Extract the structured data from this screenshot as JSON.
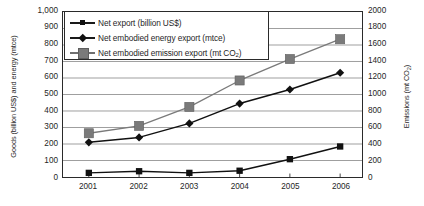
{
  "chart_data": {
    "type": "line",
    "title": "",
    "subtitle": "",
    "categories": [
      "2001",
      "2002",
      "2003",
      "2004",
      "2005",
      "2006"
    ],
    "x": [
      2001,
      2002,
      2003,
      2004,
      2005,
      2006
    ],
    "xlabel": "",
    "ylabel": "Goods (billion US$) and energy (mtce)",
    "y2label": "Emissions (mt CO2)",
    "ylim": [
      0,
      1000
    ],
    "y2lim": [
      0,
      2000
    ],
    "yticks": [
      "0",
      "100",
      "200",
      "300",
      "400",
      "500",
      "600",
      "700",
      "800",
      "900",
      "1,000"
    ],
    "y2ticks": [
      "0",
      "200",
      "400",
      "600",
      "800",
      "1000",
      "1200",
      "1400",
      "1600",
      "1800",
      "2000"
    ],
    "grid": "horizontal",
    "legend_position": "top-left-inside",
    "series": [
      {
        "name": "Net export (billion US$)",
        "axis": "left",
        "marker": "square-small",
        "color": "#111111",
        "values": [
          25,
          35,
          25,
          38,
          108,
          185
        ]
      },
      {
        "name": "Net embodied energy export (mtce)",
        "axis": "left",
        "marker": "diamond",
        "color": "#111111",
        "values": [
          210,
          240,
          325,
          445,
          530,
          632
        ]
      },
      {
        "name": "Net embodied emission export (mt CO2)",
        "axis": "right",
        "marker": "square-large",
        "color": "#7a7a7a",
        "values": [
          530,
          620,
          850,
          1170,
          1430,
          1670
        ]
      }
    ]
  },
  "axes": {
    "left_title_main": "Goods (billion US$) and energy (mtce)",
    "right_title_prefix": "Emissions (mt CO",
    "right_title_sub": "2",
    "right_title_suffix": ")"
  },
  "legend": {
    "items": [
      {
        "label": "Net export (billion US$)",
        "sub": "",
        "suffix": ""
      },
      {
        "label": "Net embodied energy export (mtce)",
        "sub": "",
        "suffix": ""
      },
      {
        "label_prefix": "Net embodied emission export (mt CO",
        "sub": "2",
        "suffix": ")"
      }
    ]
  },
  "caption": {
    "text": ""
  }
}
